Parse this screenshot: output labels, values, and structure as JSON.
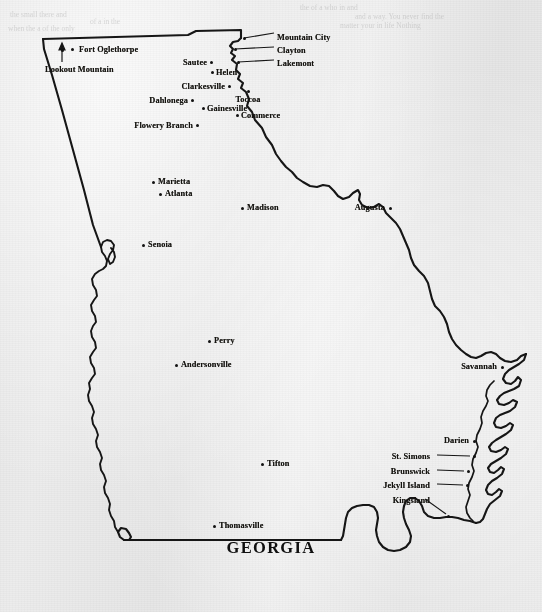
{
  "title": "GEORGIA",
  "document_type": "printed-map-scan",
  "colors": {
    "paper": "#ebebeb",
    "ink": "#141310",
    "outline": "#161616"
  },
  "cities": [
    {
      "name": "Fort Oglethorpe",
      "dot_x": 72,
      "dot_y": 49,
      "label_x": 79,
      "label_y": 46,
      "align": "left"
    },
    {
      "name": "Lookout Mountain",
      "dot_x": 62,
      "dot_y": 50,
      "label_x": 45,
      "label_y": 66,
      "align": "left",
      "leader": "arrow-up"
    },
    {
      "name": "Mountain City",
      "dot_x": 244,
      "dot_y": 38,
      "label_x": 277,
      "label_y": 34,
      "align": "left",
      "leader": "line"
    },
    {
      "name": "Clayton",
      "dot_x": 235,
      "dot_y": 49,
      "label_x": 277,
      "label_y": 47,
      "align": "left",
      "leader": "line"
    },
    {
      "name": "Lakemont",
      "dot_x": 238,
      "dot_y": 62,
      "label_x": 277,
      "label_y": 60,
      "align": "left",
      "leader": "line"
    },
    {
      "name": "Sautee",
      "dot_x": 211,
      "dot_y": 62,
      "label_x": 207,
      "label_y": 59,
      "align": "right"
    },
    {
      "name": "Helen",
      "dot_x": 212,
      "dot_y": 72,
      "label_x": 216,
      "label_y": 69,
      "align": "left"
    },
    {
      "name": "Clarkesville",
      "dot_x": 229,
      "dot_y": 86,
      "label_x": 225,
      "label_y": 83,
      "align": "right"
    },
    {
      "name": "Toccoa",
      "dot_x": 248,
      "dot_y": 91,
      "label_x": 248,
      "label_y": 96,
      "align": "center"
    },
    {
      "name": "Dahlonega",
      "dot_x": 192,
      "dot_y": 100,
      "label_x": 188,
      "label_y": 97,
      "align": "right"
    },
    {
      "name": "Gainesville",
      "dot_x": 203,
      "dot_y": 108,
      "label_x": 207,
      "label_y": 105,
      "align": "left"
    },
    {
      "name": "Commerce",
      "dot_x": 237,
      "dot_y": 115,
      "label_x": 241,
      "label_y": 112,
      "align": "left"
    },
    {
      "name": "Flowery Branch",
      "dot_x": 197,
      "dot_y": 125,
      "label_x": 193,
      "label_y": 122,
      "align": "right"
    },
    {
      "name": "Marietta",
      "dot_x": 153,
      "dot_y": 182,
      "label_x": 158,
      "label_y": 178,
      "align": "left"
    },
    {
      "name": "Atlanta",
      "dot_x": 160,
      "dot_y": 194,
      "label_x": 165,
      "label_y": 190,
      "align": "left"
    },
    {
      "name": "Madison",
      "dot_x": 242,
      "dot_y": 208,
      "label_x": 247,
      "label_y": 204,
      "align": "left"
    },
    {
      "name": "Augusta",
      "dot_x": 390,
      "dot_y": 208,
      "label_x": 385,
      "label_y": 204,
      "align": "right"
    },
    {
      "name": "Senoia",
      "dot_x": 143,
      "dot_y": 245,
      "label_x": 148,
      "label_y": 241,
      "align": "left"
    },
    {
      "name": "Perry",
      "dot_x": 209,
      "dot_y": 341,
      "label_x": 214,
      "label_y": 337,
      "align": "left"
    },
    {
      "name": "Andersonville",
      "dot_x": 176,
      "dot_y": 365,
      "label_x": 181,
      "label_y": 361,
      "align": "left"
    },
    {
      "name": "Savannah",
      "dot_x": 502,
      "dot_y": 367,
      "label_x": 497,
      "label_y": 363,
      "align": "right"
    },
    {
      "name": "Darien",
      "dot_x": 474,
      "dot_y": 441,
      "label_x": 469,
      "label_y": 437,
      "align": "right"
    },
    {
      "name": "St. Simons",
      "dot_x": 474,
      "dot_y": 456,
      "label_x": 430,
      "label_y": 453,
      "align": "right",
      "leader": "line"
    },
    {
      "name": "Brunswick",
      "dot_x": 468,
      "dot_y": 471,
      "label_x": 430,
      "label_y": 468,
      "align": "right",
      "leader": "line"
    },
    {
      "name": "Jekyll Island",
      "dot_x": 467,
      "dot_y": 485,
      "label_x": 430,
      "label_y": 482,
      "align": "right",
      "leader": "line"
    },
    {
      "name": "Kingsland",
      "dot_x": 448,
      "dot_y": 516,
      "label_x": 430,
      "label_y": 497,
      "align": "right",
      "leader": "diag"
    },
    {
      "name": "Tifton",
      "dot_x": 262,
      "dot_y": 464,
      "label_x": 267,
      "label_y": 460,
      "align": "left"
    },
    {
      "name": "Thomasville",
      "dot_x": 214,
      "dot_y": 526,
      "label_x": 219,
      "label_y": 522,
      "align": "left"
    }
  ],
  "ghost_text": [
    {
      "x": 300,
      "y": 3,
      "text": "the   of  a  who    in     and"
    },
    {
      "x": 355,
      "y": 12,
      "text": "and a way. You  never find the"
    },
    {
      "x": 340,
      "y": 21,
      "text": "matter  your    in life  Nothing"
    },
    {
      "x": 10,
      "y": 10,
      "text": "the    small    there  and"
    },
    {
      "x": 8,
      "y": 24,
      "text": "when    the   a   of  the only"
    },
    {
      "x": 90,
      "y": 17,
      "text": "of  a     in   the"
    }
  ]
}
